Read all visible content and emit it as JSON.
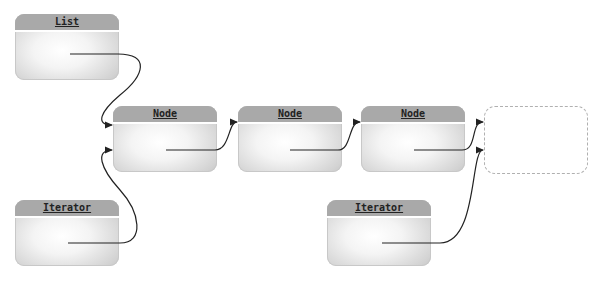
{
  "diagram": {
    "title": "",
    "colors": {
      "header": "#a9a9a9",
      "line": "#333333",
      "dashed_border": "#b0b0b0"
    },
    "boxes": [
      {
        "id": "list",
        "label": "List"
      },
      {
        "id": "node1",
        "label": "Node"
      },
      {
        "id": "node2",
        "label": "Node"
      },
      {
        "id": "node3",
        "label": "Node"
      },
      {
        "id": "iterator1",
        "label": "Iterator"
      },
      {
        "id": "iterator2",
        "label": "Iterator"
      }
    ],
    "placeholder": {
      "id": "null-end",
      "style": "dashed",
      "label": ""
    },
    "edges": [
      {
        "from": "list",
        "to": "node1"
      },
      {
        "from": "node1",
        "to": "node2"
      },
      {
        "from": "node2",
        "to": "node3"
      },
      {
        "from": "node3",
        "to": "null-end"
      },
      {
        "from": "iterator1",
        "to": "node1"
      },
      {
        "from": "iterator2",
        "to": "null-end"
      }
    ]
  }
}
